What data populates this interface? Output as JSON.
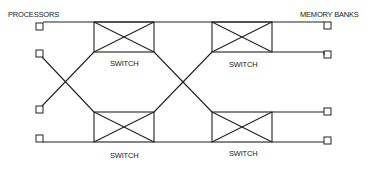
{
  "diagram": {
    "labels": {
      "processors": "PROCESSORS",
      "memory_banks": "MEMORY BANKS",
      "switch_top_left": "SWITCH",
      "switch_top_right": "SWITCH",
      "switch_bottom_left": "SWITCH",
      "switch_bottom_right": "SWITCH"
    },
    "processors_count": 4,
    "memory_banks_count": 4,
    "switches_count": 4,
    "stroke_color": "#222222",
    "background": "#ffffff"
  }
}
